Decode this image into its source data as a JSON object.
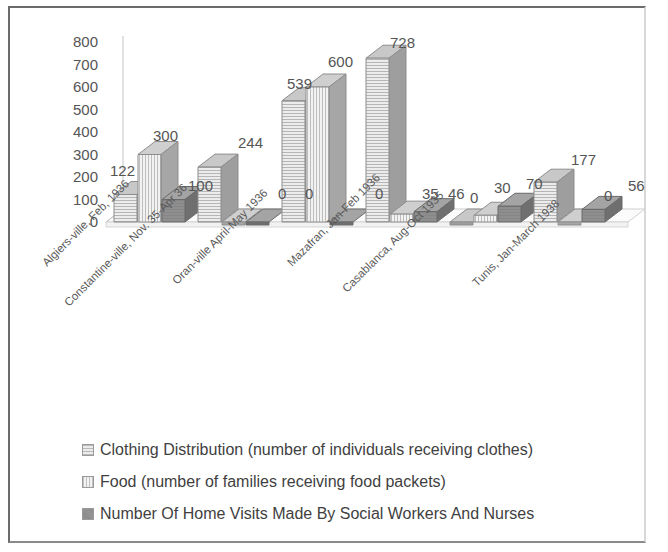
{
  "chart_data": {
    "type": "bar",
    "title": "",
    "subtitle": "",
    "xlabel": "",
    "ylabel": "",
    "ylim": [
      0,
      800
    ],
    "ytick_step": 100,
    "yticks": [
      800,
      700,
      600,
      500,
      400,
      300,
      200,
      100,
      0
    ],
    "grid": false,
    "legend_position": "bottom",
    "style": "3d-clustered-column",
    "categories": [
      "Algiers-ville, Feb, 1936",
      "Constantine-ville, Nov. 35-Apr 36",
      "Oran-ville April-May 1936",
      "Mazafran, Jan-Feb 1936",
      "Casablanca, Aug-Oct 1935",
      "Tunis, Jan-March 1938"
    ],
    "series": [
      {
        "name": "Clothing Distribution (number of individuals receiving clothes)",
        "pattern": "horizontal-lines",
        "color": "#e9e9e9",
        "values": [
          122,
          244,
          539,
          728,
          0,
          177
        ]
      },
      {
        "name": "Food (number of families receiving food packets)",
        "pattern": "vertical-lines",
        "color": "#efefef",
        "values": [
          300,
          0,
          600,
          35,
          30,
          0
        ]
      },
      {
        "name": "Number Of Home Visits Made By Social Workers And Nurses",
        "pattern": "solid-dark-gray",
        "color": "#8e8e8e",
        "values": [
          100,
          0,
          0,
          46,
          70,
          56
        ]
      }
    ],
    "data_labels": [
      [
        "122",
        "300",
        "100"
      ],
      [
        "244",
        "0",
        "0"
      ],
      [
        "539",
        "600",
        "0"
      ],
      [
        "728",
        "35",
        "46"
      ],
      [
        "0",
        "30",
        "70"
      ],
      [
        "177",
        "0",
        "56"
      ]
    ]
  },
  "legend": {
    "items": [
      {
        "label": "Clothing Distribution (number of individuals receiving clothes)"
      },
      {
        "label": "Food (number of families receiving food packets)"
      },
      {
        "label": "Number Of Home Visits Made By Social Workers And Nurses"
      }
    ]
  },
  "colors": {
    "border": "#6b6b6b",
    "axis": "#c4c4c4",
    "text": "#555555",
    "series1": "#e9e9e9",
    "series2": "#efefef",
    "series3": "#8e8e8e",
    "background": "#ffffff"
  }
}
